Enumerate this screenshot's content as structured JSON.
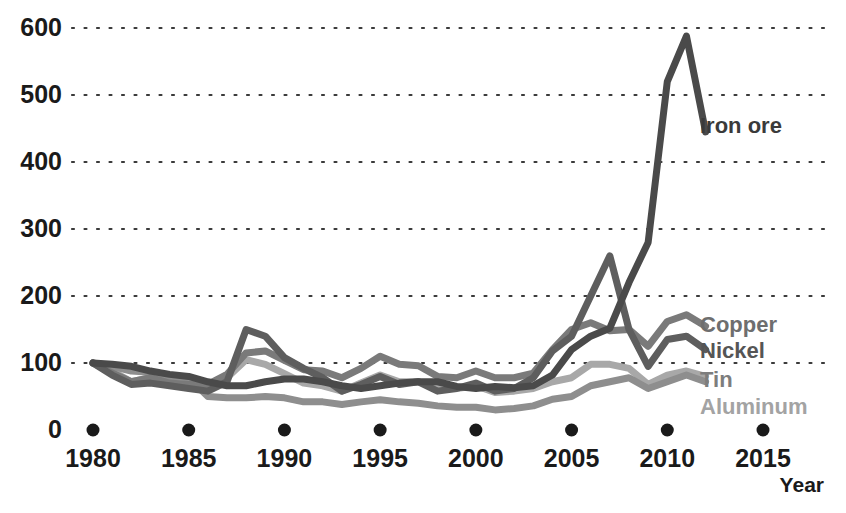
{
  "chart_data": {
    "type": "line",
    "title": "",
    "subtitle": "",
    "xlabel": "Year",
    "ylabel": "",
    "xlim": [
      1980,
      2016
    ],
    "ylim": [
      0,
      620
    ],
    "grid": "horizontal-dotted",
    "legend_position": "right-inline",
    "y_ticks": [
      0,
      100,
      200,
      300,
      400,
      500,
      600
    ],
    "x_ticks": [
      1980,
      1985,
      1990,
      1995,
      2000,
      2005,
      2010,
      2015
    ],
    "x": [
      1980,
      1981,
      1982,
      1983,
      1984,
      1985,
      1986,
      1987,
      1988,
      1989,
      1990,
      1991,
      1992,
      1993,
      1994,
      1995,
      1996,
      1997,
      1998,
      1999,
      2000,
      2001,
      2002,
      2003,
      2004,
      2005,
      2006,
      2007,
      2008,
      2009,
      2010,
      2011,
      2012
    ],
    "series": [
      {
        "name": "Iron ore",
        "color": "#4a4a4a",
        "label_color": "#3a3a3a",
        "values": [
          100,
          98,
          95,
          88,
          83,
          80,
          72,
          66,
          66,
          72,
          76,
          76,
          72,
          66,
          62,
          66,
          70,
          72,
          72,
          65,
          62,
          65,
          63,
          66,
          82,
          120,
          140,
          152,
          220,
          280,
          520,
          588,
          445
        ]
      },
      {
        "name": "Copper",
        "color": "#7a7a7a",
        "label_color": "#6e6e6e",
        "values": [
          100,
          85,
          72,
          78,
          70,
          68,
          68,
          83,
          115,
          118,
          104,
          90,
          88,
          78,
          92,
          110,
          98,
          96,
          80,
          78,
          88,
          78,
          78,
          85,
          120,
          150,
          160,
          148,
          150,
          125,
          162,
          172,
          155
        ]
      },
      {
        "name": "Nickel",
        "color": "#5e5e5e",
        "label_color": "#555555",
        "values": [
          100,
          82,
          68,
          70,
          66,
          62,
          58,
          72,
          150,
          140,
          108,
          92,
          78,
          58,
          68,
          80,
          68,
          72,
          58,
          62,
          70,
          58,
          62,
          78,
          118,
          140,
          200,
          260,
          150,
          95,
          135,
          140,
          120
        ]
      },
      {
        "name": "Tin",
        "color": "#8e8e8e",
        "label_color": "#7d7d7d",
        "values": [
          100,
          95,
          88,
          86,
          80,
          78,
          50,
          48,
          48,
          50,
          48,
          42,
          42,
          38,
          42,
          45,
          42,
          40,
          36,
          34,
          34,
          30,
          32,
          36,
          46,
          50,
          66,
          72,
          78,
          62,
          72,
          82,
          72
        ]
      },
      {
        "name": "Aluminum",
        "color": "#a8a8a8",
        "label_color": "#a3a3a3",
        "values": [
          100,
          88,
          72,
          78,
          72,
          68,
          66,
          78,
          105,
          98,
          84,
          70,
          66,
          58,
          70,
          82,
          72,
          72,
          62,
          62,
          66,
          56,
          58,
          62,
          72,
          78,
          98,
          98,
          92,
          68,
          82,
          88,
          80
        ]
      }
    ],
    "series_label_positions": [
      {
        "name": "Iron ore",
        "x": 700,
        "y": 127
      },
      {
        "name": "Copper",
        "x": 700,
        "y": 326
      },
      {
        "name": "Nickel",
        "x": 700,
        "y": 352
      },
      {
        "name": "Tin",
        "x": 700,
        "y": 381
      },
      {
        "name": "Aluminum",
        "x": 700,
        "y": 408
      }
    ]
  },
  "axes": {
    "y_tick_labels": [
      "600",
      "500",
      "400",
      "300",
      "200",
      "100",
      "0"
    ],
    "x_tick_labels": [
      "1980",
      "1985",
      "1990",
      "1995",
      "2000",
      "2005",
      "2010",
      "2015"
    ],
    "x_axis_title": "Year"
  },
  "colors": {
    "background": "#ffffff",
    "text": "#1a1a1a",
    "grid": "#3a3a3a"
  }
}
